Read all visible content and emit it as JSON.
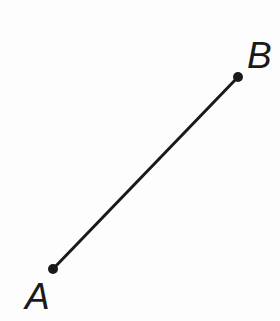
{
  "figure": {
    "type": "geometry-diagram",
    "background_color": "#fdfdfd",
    "stroke_color": "#1a1a1a",
    "stroke_width": 3,
    "canvas": {
      "width": 280,
      "height": 321
    },
    "segment": {
      "name": "segment-AB",
      "from": "A",
      "to": "B",
      "x1": 53,
      "y1": 269,
      "x2": 238,
      "y2": 77
    },
    "points": [
      {
        "id": "A",
        "label": "A",
        "x": 53,
        "y": 269,
        "radius": 5,
        "fill": "#1a1a1a",
        "label_x": 25,
        "label_y": 278
      },
      {
        "id": "B",
        "label": "B",
        "x": 238,
        "y": 77,
        "radius": 5,
        "fill": "#1a1a1a",
        "label_x": 247,
        "label_y": 37
      }
    ]
  },
  "chart_data": {
    "type": "scatter",
    "xlabel": "",
    "ylabel": "",
    "series": [
      {
        "name": "segment-AB",
        "points": [
          {
            "label": "A",
            "x": 53,
            "y": 269
          },
          {
            "label": "B",
            "x": 238,
            "y": 77
          }
        ]
      }
    ],
    "annotations": [
      "A",
      "B"
    ],
    "grid": false,
    "legend": "none",
    "xlim": [
      0,
      280
    ],
    "ylim": [
      0,
      321
    ]
  }
}
